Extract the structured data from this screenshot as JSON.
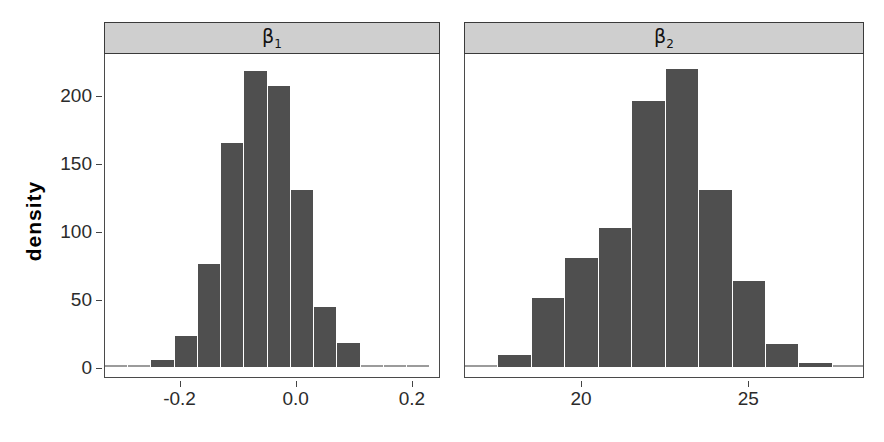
{
  "figure": {
    "background": "#ffffff",
    "bar_color": "#4f4f4f",
    "strip_color": "#cfcfcf",
    "axis_color": "#444444",
    "ylabel": "density"
  },
  "yaxis": {
    "ticks": [
      {
        "label": "0",
        "value": 0
      },
      {
        "label": "50",
        "value": 50
      },
      {
        "label": "100",
        "value": 100
      },
      {
        "label": "150",
        "value": 150
      },
      {
        "label": "200",
        "value": 200
      }
    ],
    "limits": [
      0,
      228
    ]
  },
  "panels": [
    {
      "id": "beta1",
      "strip_label": "β",
      "strip_sub": "1",
      "xticks": [
        {
          "label": "-0.2",
          "value": -0.2
        },
        {
          "label": "0.0",
          "value": 0.0
        },
        {
          "label": "0.2",
          "value": 0.2
        }
      ],
      "xlim": [
        -0.33,
        0.245
      ],
      "bin_width": 0.04
    },
    {
      "id": "beta2",
      "strip_label": "β",
      "strip_sub": "2",
      "xticks": [
        {
          "label": "20",
          "value": 20
        },
        {
          "label": "25",
          "value": 25
        }
      ],
      "xlim": [
        16.5,
        28.4
      ],
      "bin_width": 1.0
    }
  ],
  "chart_data": {
    "type": "bar",
    "title": "",
    "subtitle": "",
    "xlabel": "",
    "ylabel": "density",
    "grid": false,
    "legend": "none",
    "layout": "1 row x 2 columns, shared y-axis, strip labels on top",
    "ylim": [
      0,
      228
    ],
    "panels": [
      {
        "name": "β₁",
        "type": "histogram",
        "xlabel": "",
        "xlim": [
          -0.33,
          0.245
        ],
        "xticks": [
          -0.2,
          0.0,
          0.2
        ],
        "bin_width": 0.04,
        "bin_centers": [
          -0.31,
          -0.27,
          -0.23,
          -0.19,
          -0.15,
          -0.11,
          -0.07,
          -0.03,
          0.01,
          0.05,
          0.09,
          0.13,
          0.17,
          0.21
        ],
        "bin_edges": [
          -0.33,
          -0.29,
          -0.25,
          -0.21,
          -0.17,
          -0.13,
          -0.09,
          -0.05,
          -0.01,
          0.03,
          0.07,
          0.11,
          0.15,
          0.19,
          0.23
        ],
        "values": [
          1,
          1,
          5,
          23,
          76,
          165,
          218,
          207,
          130,
          44,
          18,
          1,
          0,
          0
        ]
      },
      {
        "name": "β₂",
        "type": "histogram",
        "xlabel": "",
        "xlim": [
          16.5,
          28.4
        ],
        "xticks": [
          20,
          25
        ],
        "bin_width": 1.0,
        "bin_centers": [
          17.0,
          18.0,
          19.0,
          20.0,
          21.0,
          22.0,
          23.0,
          24.0,
          25.0,
          26.0,
          27.0,
          28.0
        ],
        "bin_edges": [
          16.5,
          17.5,
          18.5,
          19.5,
          20.5,
          21.5,
          22.5,
          23.5,
          24.5,
          25.5,
          26.5,
          27.5,
          28.5
        ],
        "values": [
          1,
          9,
          51,
          80,
          102,
          196,
          219,
          130,
          63,
          17,
          3,
          1
        ]
      }
    ]
  }
}
